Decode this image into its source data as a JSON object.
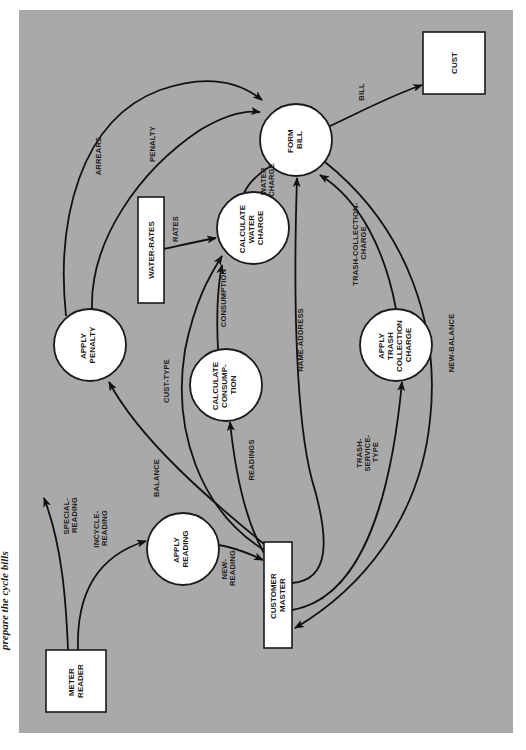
{
  "caption_fragment": "prepare the cycle bills",
  "colors": {
    "panel": "#a9a9a9",
    "node_fill": "#ffffff",
    "line": "#111111",
    "page": "#ffffff"
  },
  "nodes": {
    "meter_reader": {
      "type": "external-entity",
      "lines": [
        "METER",
        "READER"
      ]
    },
    "apply_reading": {
      "type": "process",
      "lines": [
        "APPLY",
        "READING"
      ]
    },
    "customer_master": {
      "type": "data-store",
      "lines": [
        "CUSTOMER",
        "MASTER"
      ]
    },
    "apply_penalty": {
      "type": "process",
      "lines": [
        "APPLY",
        "PENALTY"
      ]
    },
    "calculate_consumption": {
      "type": "process",
      "lines": [
        "CALCULATE",
        "CONSUMP-",
        "TION"
      ]
    },
    "calculate_water_charge": {
      "type": "process",
      "lines": [
        "CALCULATE",
        "WATER",
        "CHARGE"
      ]
    },
    "water_rates": {
      "type": "data-store",
      "lines": [
        "WATER-RATES"
      ]
    },
    "form_bill": {
      "type": "process",
      "lines": [
        "FORM",
        "BILL"
      ]
    },
    "cust": {
      "type": "external-entity",
      "lines": [
        "CUST"
      ]
    },
    "apply_trash": {
      "type": "process",
      "lines": [
        "APPLY",
        "TRASH",
        "COLLECTION",
        "CHARGE"
      ]
    }
  },
  "flows": {
    "special_reading": {
      "from": "METER READER",
      "to": "(off-diagram)",
      "lines": [
        "SPECIAL-",
        "READING"
      ]
    },
    "incycle_reading": {
      "from": "METER READER",
      "to": "APPLY READING",
      "lines": [
        "INCYCLE-",
        "READING"
      ]
    },
    "new_reading": {
      "from": "APPLY READING",
      "to": "CUSTOMER MASTER",
      "lines": [
        "NEW-",
        "READING"
      ]
    },
    "balance": {
      "from": "CUSTOMER MASTER",
      "to": "APPLY PENALTY",
      "lines": [
        "BALANCE"
      ]
    },
    "cust_type": {
      "from": "CUSTOMER MASTER",
      "to": "CALCULATE WATER CHARGE",
      "lines": [
        "CUST-TYPE"
      ]
    },
    "readings": {
      "from": "CUSTOMER MASTER",
      "to": "CALCULATE CONSUMPTION",
      "lines": [
        "READINGS"
      ]
    },
    "name_address": {
      "from": "CUSTOMER MASTER",
      "to": "FORM BILL",
      "lines": [
        "NAME-ADDRESS"
      ]
    },
    "trash_service_type": {
      "from": "CUSTOMER MASTER",
      "to": "APPLY TRASH COLLECTION CHARGE",
      "lines": [
        "TRASH-",
        "SERVICE-",
        "TYPE"
      ]
    },
    "new_balance": {
      "from": "FORM BILL",
      "to": "CUSTOMER MASTER",
      "lines": [
        "NEW-BALANCE"
      ]
    },
    "arrears": {
      "from": "APPLY PENALTY",
      "to": "FORM BILL",
      "lines": [
        "ARREARS"
      ]
    },
    "penalty": {
      "from": "APPLY PENALTY",
      "to": "FORM BILL",
      "lines": [
        "PENALTY"
      ]
    },
    "rates": {
      "from": "WATER-RATES",
      "to": "CALCULATE WATER CHARGE",
      "lines": [
        "RATES"
      ]
    },
    "consumption": {
      "from": "CALCULATE CONSUMPTION",
      "to": "CALCULATE WATER CHARGE",
      "lines": [
        "CONSUMPTION"
      ]
    },
    "water_charge": {
      "from": "CALCULATE WATER CHARGE",
      "to": "FORM BILL",
      "lines": [
        "WATER",
        "CHARGE"
      ]
    },
    "trash_collection_charge": {
      "from": "APPLY TRASH COLLECTION CHARGE",
      "to": "FORM BILL",
      "lines": [
        "TRASH-COLLECTION-",
        "CHARGE"
      ]
    },
    "bill": {
      "from": "FORM BILL",
      "to": "CUST",
      "lines": [
        "BILL"
      ]
    }
  }
}
